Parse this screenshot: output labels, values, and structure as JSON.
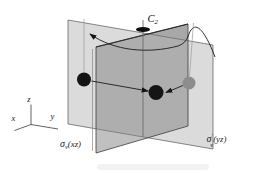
{
  "diagram": {
    "rotation_axis_label": {
      "base": "C",
      "sub": "2"
    },
    "plane_labels": {
      "xz": {
        "sigma": "σ",
        "sub": "v",
        "prime": "",
        "rest": "(xz)"
      },
      "yz": {
        "sigma": "σ",
        "sub": "v",
        "prime": "′",
        "rest": "(yz)"
      }
    },
    "axes": {
      "x": "x",
      "y": "y",
      "z": "z"
    },
    "atoms": {
      "left": {
        "color": "#151515"
      },
      "center": {
        "color": "#151515"
      },
      "right": {
        "color": "#8d8d8d"
      }
    },
    "colors": {
      "plane_xz_fill": "rgba(130,130,130,0.5)",
      "plane_yz_fill": "rgba(170,170,170,0.42)",
      "plane_edge": "#444444",
      "arrow": "#1b1b1b",
      "background": "#ffffff"
    }
  }
}
